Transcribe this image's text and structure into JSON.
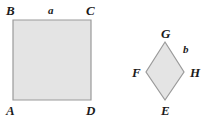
{
  "figure": {
    "background_color": "#ffffff",
    "shape_fill_color": "#e4e4e4",
    "shape_stroke_color": "#9a9a9a",
    "label_color": "#1b1b1b"
  },
  "square": {
    "name": "square-ABCD",
    "vertices": {
      "B": "B",
      "C": "C",
      "A": "A",
      "D": "D"
    },
    "side_label": "a"
  },
  "diamond": {
    "name": "square-EFGH-rotated",
    "vertices": {
      "G": "G",
      "H": "H",
      "E": "E",
      "F": "F"
    },
    "side_label": "b"
  }
}
